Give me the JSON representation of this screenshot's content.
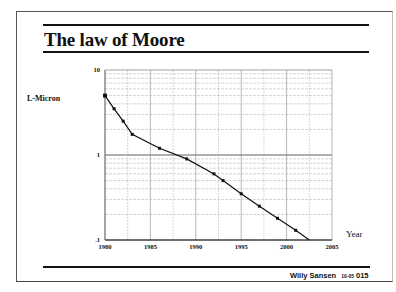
{
  "slide": {
    "title": "The law of Moore",
    "footer_author": "Willy Sansen",
    "footer_code": "10-05",
    "footer_page": "015"
  },
  "chart_data": {
    "type": "line",
    "title": "The law of Moore",
    "xlabel": "Year",
    "ylabel": "L-Micron",
    "x_ticks": [
      "1980",
      "1985",
      "1990",
      "1995",
      "2000",
      "2005"
    ],
    "y_ticks": [
      "10",
      "1",
      ".1"
    ],
    "yscale": "log",
    "xlim": [
      1980,
      2005
    ],
    "ylim": [
      0.1,
      10
    ],
    "grid": true,
    "legend": null,
    "series": [
      {
        "name": "L-Micron",
        "marker": "square",
        "x": [
          1980,
          1981,
          1982,
          1983,
          1986,
          1989,
          1992,
          1993,
          1995,
          1997,
          1999,
          2001,
          2002.5
        ],
        "values": [
          5,
          3.5,
          2.5,
          1.75,
          1.2,
          0.9,
          0.6,
          0.5,
          0.35,
          0.25,
          0.18,
          0.13,
          0.1
        ]
      }
    ]
  }
}
